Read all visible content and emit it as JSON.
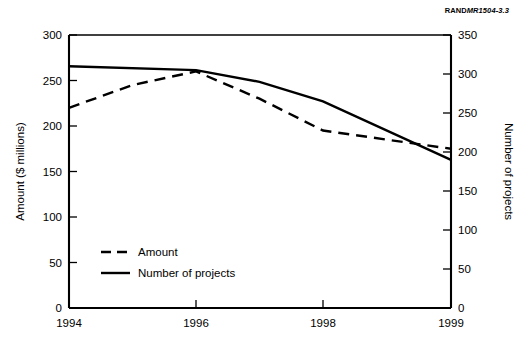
{
  "credit": {
    "brand": "RAND",
    "document_id": "MR1504-3.3"
  },
  "chart_data": {
    "type": "line",
    "title": "",
    "xlabel": "",
    "x": [
      "1994",
      "1995",
      "1996",
      "1997",
      "1998",
      "1999"
    ],
    "xtick_labels": [
      "1994",
      "1996",
      "1998",
      "1999"
    ],
    "xtick_values": [
      1994,
      1996,
      1998,
      1999
    ],
    "xlim": [
      1994,
      1999
    ],
    "grid": false,
    "legend_position": "lower-left-inside",
    "axes": [
      {
        "id": "left",
        "ylabel": "Amount ($ millions)",
        "ylim": [
          0,
          300
        ],
        "yticks": [
          0,
          50,
          100,
          150,
          200,
          250,
          300
        ],
        "ytick_labels": [
          "0",
          "50",
          "100",
          "150",
          "200",
          "250",
          "300"
        ]
      },
      {
        "id": "right",
        "ylabel": "Number of projects",
        "ylim": [
          0,
          350
        ],
        "yticks": [
          0,
          50,
          100,
          150,
          200,
          250,
          300,
          350
        ],
        "ytick_labels": [
          "0",
          "50",
          "100",
          "150",
          "200",
          "250",
          "300",
          "350"
        ]
      }
    ],
    "series": [
      {
        "name": "Amount",
        "axis": "left",
        "style": "dashed",
        "color": "#000000",
        "x": [
          1994,
          1995,
          1996,
          1997,
          1998,
          1999
        ],
        "values": [
          220,
          245,
          260,
          230,
          195,
          175
        ]
      },
      {
        "name": "Number of projects",
        "axis": "right",
        "style": "solid",
        "color": "#000000",
        "x": [
          1994,
          1996,
          1997,
          1998,
          1999
        ],
        "values": [
          310,
          305,
          290,
          265,
          190
        ]
      }
    ],
    "legend": [
      {
        "label": "Amount",
        "style": "dashed"
      },
      {
        "label": "Number of projects",
        "style": "solid"
      }
    ]
  }
}
